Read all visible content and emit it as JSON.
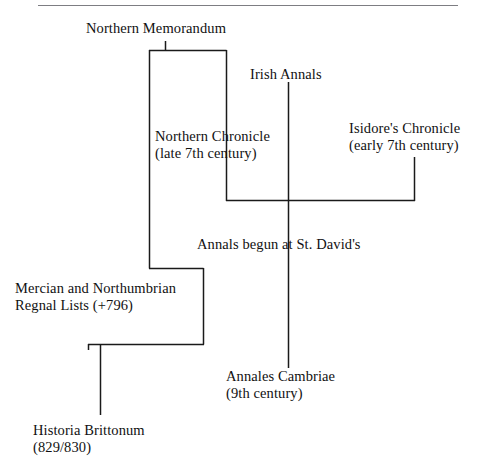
{
  "page": {
    "background": "#ffffff",
    "line_color": "#1a1a1a",
    "text_color": "#111111",
    "rule_color": "#7d7d82",
    "width": 492,
    "height": 475,
    "top_fragment": ""
  },
  "diagram": {
    "type": "stemma",
    "nodes": [
      {
        "id": "northern-memorandum",
        "lines": [
          "Northern Memorandum"
        ],
        "x": 86,
        "y": 20
      },
      {
        "id": "irish-annals",
        "lines": [
          "Irish Annals"
        ],
        "x": 250,
        "y": 66
      },
      {
        "id": "northern-chronicle",
        "lines": [
          "Northern Chronicle",
          "(late 7th century)"
        ],
        "x": 155,
        "y": 128
      },
      {
        "id": "isidores-chronicle",
        "lines": [
          "Isidore's Chronicle",
          "(early 7th century)"
        ],
        "x": 349,
        "y": 120
      },
      {
        "id": "annals-begun-at-st-davids",
        "lines": [
          "Annals begun at St. David's"
        ],
        "x": 197,
        "y": 236
      },
      {
        "id": "mercian-and-northumbrian-regnal-lists",
        "lines": [
          "Mercian and Northumbrian",
          "Regnal Lists (+796)"
        ],
        "x": 15,
        "y": 280
      },
      {
        "id": "annales-cambriae",
        "lines": [
          "Annales Cambriae",
          "(9th century)"
        ],
        "x": 226,
        "y": 368
      },
      {
        "id": "historia-brittonum",
        "lines": [
          "Historia Brittonum",
          "(829/830)"
        ],
        "x": 33,
        "y": 422
      }
    ],
    "connectors": [
      {
        "id": "northern-memorandum-stem",
        "from": "northern-memorandum",
        "path": "M 165.5 41 L 165.5 50.5"
      },
      {
        "id": "memorandum-crossbar",
        "path": "M 149 50.5 L 226.5 50.5"
      },
      {
        "id": "crossbar-left-drop",
        "path": "M 149.5 50 L 149.5 268.5"
      },
      {
        "id": "crossbar-right-drop",
        "path": "M 226.5 50 L 226.5 201"
      },
      {
        "id": "irish-annals-stem",
        "from": "irish-annals",
        "path": "M 288.5 82 L 288.5 368"
      },
      {
        "id": "isidore-stem",
        "path": "M 414.5 157 L 414.5 201"
      },
      {
        "id": "st-davids-join",
        "path": "M 226 200.5 L 415 200.5"
      },
      {
        "id": "regnal-lists-upper",
        "path": "M 149 268.5 L 203.5 268.5"
      },
      {
        "id": "regnal-lists-right",
        "path": "M 203.5 268 L 203.5 344.5"
      },
      {
        "id": "regnal-lists-lower",
        "path": "M 88 344.5 L 204 344.5"
      },
      {
        "id": "regnal-lists-left",
        "path": "M 88.5 344 L 88.5 350"
      },
      {
        "id": "historia-brittonum-stem",
        "path": "M 100.5 344 L 100.5 415"
      }
    ]
  }
}
